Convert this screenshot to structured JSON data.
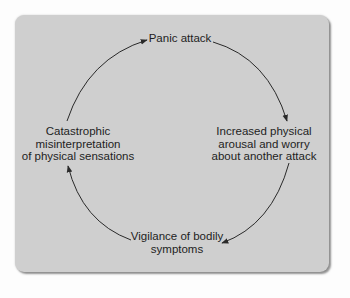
{
  "diagram": {
    "type": "cycle",
    "colors": {
      "panel_background": "#cfcfcf",
      "page_background": "#fdfdfd",
      "text": "#1e1e1e",
      "arrow": "#2a2a2a"
    },
    "nodes": [
      {
        "id": "panic",
        "lines": [
          "Panic attack"
        ]
      },
      {
        "id": "arousal",
        "lines": [
          "Increased physical",
          "arousal and worry",
          "about another attack"
        ]
      },
      {
        "id": "vigilance",
        "lines": [
          "Vigilance of bodily",
          "symptoms"
        ]
      },
      {
        "id": "misinterpretation",
        "lines": [
          "Catastrophic",
          "misinterpretation",
          "of physical sensations"
        ]
      }
    ],
    "edges": [
      {
        "from": "panic",
        "to": "arousal"
      },
      {
        "from": "arousal",
        "to": "vigilance"
      },
      {
        "from": "vigilance",
        "to": "misinterpretation"
      },
      {
        "from": "misinterpretation",
        "to": "panic"
      }
    ]
  }
}
